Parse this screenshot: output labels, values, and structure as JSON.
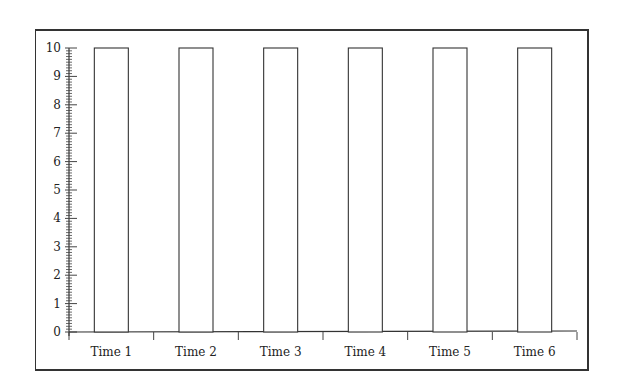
{
  "chart_data": {
    "type": "bar",
    "title": "",
    "xlabel": "",
    "ylabel": "",
    "categories": [
      "Time 1",
      "Time 2",
      "Time 3",
      "Time 4",
      "Time 5",
      "Time 6"
    ],
    "values": [
      10,
      10,
      10,
      10,
      10,
      10
    ],
    "ylim": [
      0,
      10
    ],
    "yticks": [
      0,
      1,
      2,
      3,
      4,
      5,
      6,
      7,
      8,
      9,
      10
    ],
    "minor_tick_step": 0.1,
    "grid": false,
    "legend": null,
    "bar_fill": "#ffffff",
    "bar_stroke": "#333333"
  }
}
